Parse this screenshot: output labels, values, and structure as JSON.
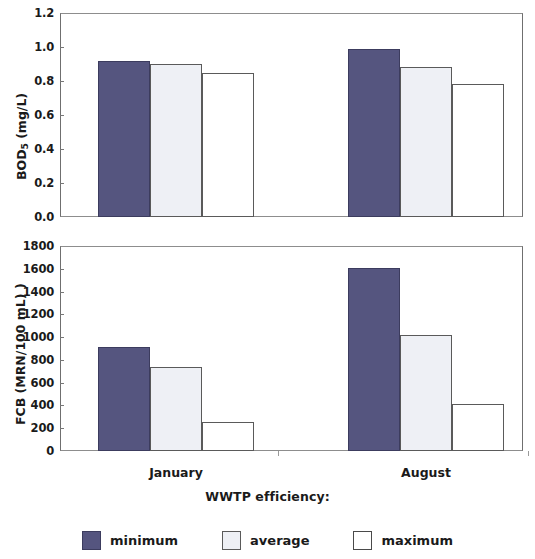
{
  "chart_data": [
    {
      "type": "bar",
      "panel": "top",
      "title": "",
      "ylabel": "BOD5 (mg/L)",
      "ylabel_base": "BOD",
      "ylabel_sub": "5",
      "ylabel_rest": " (mg/L)",
      "xlabel": "",
      "categories": [
        "January",
        "August"
      ],
      "ylim": [
        0.0,
        1.2
      ],
      "yticks": [
        "0.0",
        "0.2",
        "0.4",
        "0.6",
        "0.8",
        "1.0",
        "1.2"
      ],
      "ytick_values": [
        0.0,
        0.2,
        0.4,
        0.6,
        0.8,
        1.0,
        1.2
      ],
      "grid": false,
      "series": [
        {
          "name": "minimum",
          "values": [
            0.92,
            0.99
          ],
          "color": "#55557f"
        },
        {
          "name": "average",
          "values": [
            0.9,
            0.88
          ],
          "color": "#eef0f5"
        },
        {
          "name": "maximum",
          "values": [
            0.85,
            0.78
          ],
          "color": "#ffffff"
        }
      ]
    },
    {
      "type": "bar",
      "panel": "bottom",
      "title": "",
      "ylabel": "FCB (MRN/100 mL) )",
      "xlabel": "WWTP efficiency:",
      "categories": [
        "January",
        "August"
      ],
      "ylim": [
        0,
        1800
      ],
      "yticks": [
        "0",
        "200",
        "400",
        "600",
        "800",
        "1000",
        "1200",
        "1400",
        "1600",
        "1800"
      ],
      "ytick_values": [
        0,
        200,
        400,
        600,
        800,
        1000,
        1200,
        1400,
        1600,
        1800
      ],
      "grid": false,
      "series": [
        {
          "name": "minimum",
          "values": [
            910,
            1610
          ],
          "color": "#55557f"
        },
        {
          "name": "average",
          "values": [
            740,
            1020
          ],
          "color": "#eef0f5"
        },
        {
          "name": "maximum",
          "values": [
            255,
            410
          ],
          "color": "#ffffff"
        }
      ]
    }
  ],
  "axes": {
    "x_title": "WWTP efficiency:",
    "categories": [
      "January",
      "August"
    ]
  },
  "legend": {
    "position": "bottom",
    "items": [
      {
        "label": "minimum",
        "swatch": "min",
        "color": "#55557f"
      },
      {
        "label": "average",
        "swatch": "avg",
        "color": "#eef0f5"
      },
      {
        "label": "maximum",
        "swatch": "max",
        "color": "#ffffff"
      }
    ]
  },
  "colors": {
    "minimum": "#55557f",
    "average": "#eef0f5",
    "maximum": "#ffffff",
    "axis": "#6f6f6f",
    "text": "#1a1a1a"
  }
}
